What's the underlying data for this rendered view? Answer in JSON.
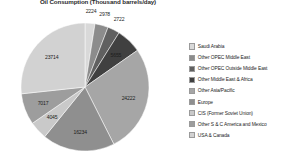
{
  "chart_data": {
    "type": "pie",
    "title": "Oil Consumption (Thousand barrels/day)",
    "xlabel": "",
    "ylabel": "",
    "legend_position": "right",
    "grid": false,
    "categories": [
      "Saudi Arabia",
      "Other OPEC Middle East",
      "Other OPEC Outside Middle East",
      "Other Middle East & Africa",
      "Other Asia/Pacific",
      "Europe",
      "CIS (Former Soviet Union)",
      "Other S & C America and Mexico",
      "USA & Canada"
    ],
    "values": [
      2224,
      2978,
      2722,
      5655,
      24222,
      16234,
      4045,
      7017,
      23714
    ],
    "colors": [
      "#d9d9d9",
      "#8c8c8c",
      "#606060",
      "#404040",
      "#a6a6a6",
      "#8f8f8f",
      "#c9c9c9",
      "#9d9d9d",
      "#d2d2d2"
    ],
    "labels": [
      "2224",
      "2978",
      "2722",
      "5655",
      "24222",
      "16234",
      "4045",
      "7017",
      "23714"
    ]
  },
  "legend": {
    "items": [
      {
        "label": "Saudi Arabia",
        "color": "#d9d9d9"
      },
      {
        "label": "Other OPEC Middle East",
        "color": "#8c8c8c"
      },
      {
        "label": "Other OPEC Outside Middle East",
        "color": "#606060"
      },
      {
        "label": "Other Middle East & Africa",
        "color": "#404040"
      },
      {
        "label": "Other Asia/Pacific",
        "color": "#a6a6a6"
      },
      {
        "label": "Europe",
        "color": "#8f8f8f"
      },
      {
        "label": "CIS (Former Soviet Union)",
        "color": "#c9c9c9"
      },
      {
        "label": "Other S & C America and Mexico",
        "color": "#9d9d9d"
      },
      {
        "label": "USA & Canada",
        "color": "#d2d2d2"
      }
    ]
  }
}
